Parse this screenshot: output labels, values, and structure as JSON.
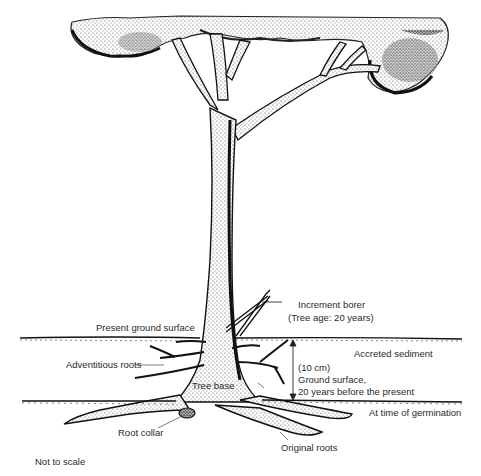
{
  "diagram": {
    "type": "illustration",
    "labels": {
      "increment_borer": "Increment borer",
      "tree_age": "(Tree age: 20 years)",
      "present_ground_surface": "Present ground surface",
      "adventitious_roots": "Adventitious roots",
      "accreted_sediment": "Accreted sediment",
      "depth": "(10 cm)",
      "past_ground_line1": "Ground surface,",
      "past_ground_line2": "20 years before the present",
      "tree_base": "Tree base",
      "at_germination": "At time of germination",
      "root_collar": "Root collar",
      "original_roots": "Original roots",
      "not_to_scale": "Not to scale"
    },
    "colors": {
      "ink": "#111111",
      "stipple": "#555555",
      "background": "#ffffff"
    }
  }
}
